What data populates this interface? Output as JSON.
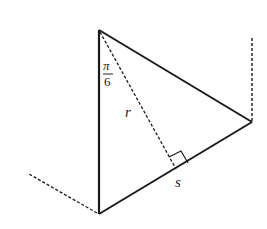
{
  "diagram": {
    "type": "geometry-triangle",
    "vertices": {
      "top": [
        99,
        30
      ],
      "right": [
        252,
        122
      ],
      "bottom": [
        99,
        214
      ]
    },
    "labels": {
      "angle_numerator": "π",
      "angle_denominator": "6",
      "radius": "r",
      "side": "s"
    },
    "colors": {
      "stroke": "#1a1a1a",
      "background": "#ffffff"
    }
  }
}
